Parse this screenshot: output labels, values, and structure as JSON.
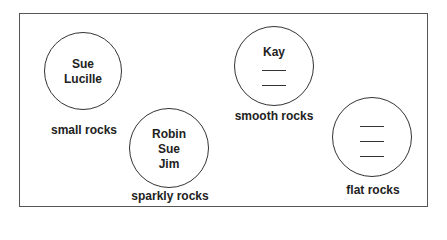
{
  "diagram": {
    "type": "grouping circles",
    "groups": [
      {
        "label": "small rocks",
        "members": [
          "Sue",
          "Lucille"
        ],
        "blanks": 0,
        "circle": {
          "cx": 83,
          "cy": 71,
          "r": 39
        },
        "label_pos": {
          "x": 84,
          "y": 123
        }
      },
      {
        "label": "sparkly rocks",
        "members": [
          "Robin",
          "Sue",
          "Jim"
        ],
        "blanks": 0,
        "circle": {
          "cx": 169,
          "cy": 148,
          "r": 40
        },
        "label_pos": {
          "x": 170,
          "y": 189
        }
      },
      {
        "label": "smooth rocks",
        "members": [
          "Kay"
        ],
        "blanks": 2,
        "circle": {
          "cx": 274,
          "cy": 66,
          "r": 40
        },
        "label_pos": {
          "x": 274,
          "y": 109
        }
      },
      {
        "label": "flat rocks",
        "members": [],
        "blanks": 3,
        "circle": {
          "cx": 372,
          "cy": 137,
          "r": 40
        },
        "label_pos": {
          "x": 373,
          "y": 183
        }
      }
    ]
  },
  "colors": {
    "line": "#333333",
    "text": "#222222",
    "frame": "#555555",
    "background": "#ffffff"
  }
}
